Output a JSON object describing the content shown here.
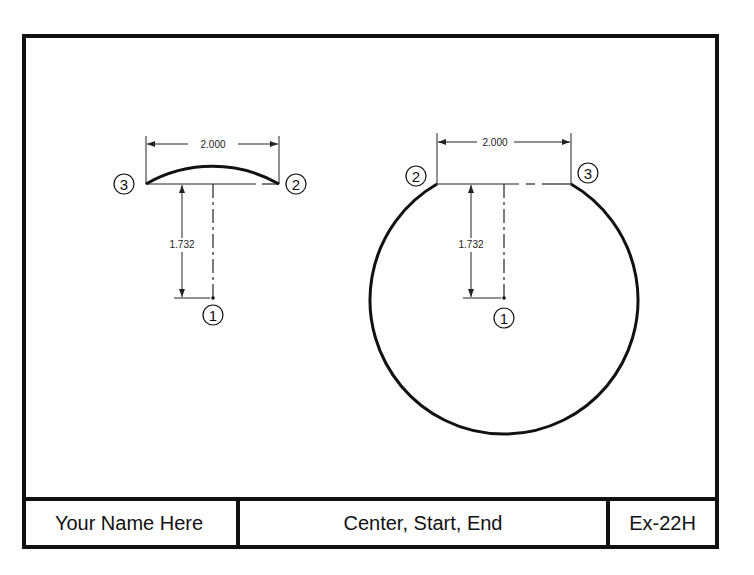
{
  "drawing": {
    "left_figure": {
      "chord_dimension": "2.000",
      "height_dimension": "1.732",
      "point_labels": {
        "p1": "1",
        "p2": "2",
        "p3": "3"
      }
    },
    "right_figure": {
      "chord_dimension": "2.000",
      "height_dimension": "1.732",
      "point_labels": {
        "p1": "1",
        "p2": "2",
        "p3": "3"
      }
    }
  },
  "title_block": {
    "name": "Your Name Here",
    "title": "Center, Start, End",
    "exercise": "Ex-22H"
  },
  "colors": {
    "line": "#111111",
    "background": "#ffffff"
  }
}
